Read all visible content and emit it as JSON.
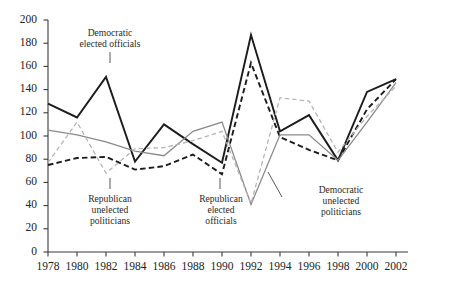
{
  "chart_data": {
    "type": "line",
    "title": "",
    "xlabel": "",
    "ylabel": "",
    "xlim": [
      1978,
      2002
    ],
    "ylim": [
      0,
      200
    ],
    "grid": false,
    "legend_position": "inline-annotations",
    "x": [
      1978,
      1980,
      1982,
      1984,
      1986,
      1988,
      1990,
      1992,
      1994,
      1996,
      1998,
      2000,
      2002
    ],
    "xtick_labels": [
      "1978",
      "1980",
      "1982",
      "1984",
      "1986",
      "1988",
      "1990",
      "1992",
      "1994",
      "1996",
      "1998",
      "2000",
      "2002"
    ],
    "ytick_labels": [
      "0",
      "20",
      "40",
      "60",
      "80",
      "100",
      "120",
      "140",
      "160",
      "180",
      "200"
    ],
    "ytick_values": [
      0,
      20,
      40,
      60,
      80,
      100,
      120,
      140,
      160,
      180,
      200
    ],
    "series": [
      {
        "name": "Democratic elected officials",
        "style": "solid",
        "color": "#1c1c1c",
        "width": 1.9,
        "values": [
          128,
          116,
          151,
          78,
          110,
          93,
          77,
          187,
          104,
          118,
          79,
          138,
          149
        ]
      },
      {
        "name": "Republican unelected politicians",
        "style": "dashed",
        "color": "#1c1c1c",
        "width": 1.9,
        "values": [
          75,
          81,
          82,
          71,
          74,
          84,
          67,
          163,
          99,
          88,
          79,
          123,
          149
        ]
      },
      {
        "name": "Republican elected officials",
        "style": "solid",
        "color": "#8a8a8a",
        "width": 1.3,
        "values": [
          105,
          101,
          95,
          87,
          83,
          104,
          112,
          41,
          101,
          101,
          79,
          112,
          146
        ]
      },
      {
        "name": "Democratic unelected politicians",
        "style": "dashed",
        "color": "#b5b5b5",
        "width": 1.3,
        "values": [
          77,
          112,
          68,
          89,
          90,
          96,
          104,
          42,
          133,
          130,
          86,
          117,
          143
        ]
      }
    ],
    "annotations": [
      {
        "id": "democratic-elected-officials",
        "lines": [
          "Democratic",
          "elected officials"
        ],
        "target_x": 1982,
        "target_y": 151,
        "text_left": 61,
        "text_top": 27,
        "leader_x": 110,
        "leader_y1": 52,
        "leader_y2": 63
      },
      {
        "id": "republican-unelected-politicians",
        "lines": [
          "Republican",
          "unelected",
          "politicians"
        ],
        "target_x": 1982,
        "target_y": 82,
        "text_left": 61,
        "text_top": 193,
        "leader_x": 110,
        "leader_y1": 178,
        "leader_y2": 189
      },
      {
        "id": "republican-elected-officials",
        "lines": [
          "Republican",
          "elected",
          "officials"
        ],
        "target_x": 1988,
        "target_y": 104,
        "text_left": 172,
        "text_top": 193,
        "leader_x": 220,
        "leader_y1": 178,
        "leader_y2": 189
      },
      {
        "id": "democratic-unelected-politicians",
        "lines": [
          "Democratic",
          "unelected",
          "politicians"
        ],
        "target_x": 1993,
        "target_y": 70,
        "text_left": 292,
        "text_top": 184,
        "leader_from_x": 282,
        "leader_from_y": 197,
        "leader_to_x": 268,
        "leader_to_y": 172
      }
    ]
  },
  "axes": {
    "y_axis_label": "",
    "x_axis_label": "",
    "axis_color": "#3a3a3a"
  }
}
